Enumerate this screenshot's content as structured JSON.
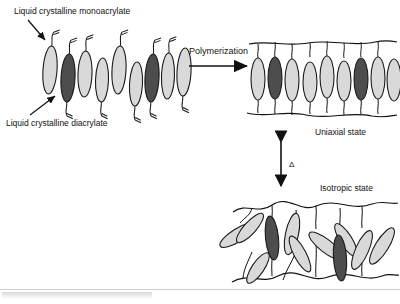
{
  "figure": {
    "type": "schematic-diagram",
    "labels": {
      "monoacrylate": "Liquid crystalline monoacrylate",
      "diacrylate": "Liquid crystalline diacrylate",
      "polymerization": "Polymerization",
      "uniaxial_state": "Uniaxial state",
      "isotropic_state": "Isotropic state",
      "temperature_symbol": "Δ"
    },
    "colors": {
      "monoacrylate_fill": "#d9d9d9",
      "diacrylate_fill": "#4d4d4d",
      "outline": "#1a1a1a",
      "background": "#ffffff",
      "caption_rule": "#cfcfcf"
    },
    "panels": [
      {
        "name": "monomer-mixture",
        "description": "Row of nine tilted rod-like mesogens, light ones are monofunctional with a single acrylate tail, dark ones are difunctional with tails at both ends",
        "mesogen_count": 9,
        "dark_indices": [
          1,
          5
        ],
        "arrow_annotations": [
          {
            "name": "monoacrylate-pointer",
            "points_to": "light mesogen, upper left"
          },
          {
            "name": "diacrylate-pointer",
            "points_to": "dark mesogen, lower left"
          }
        ]
      },
      {
        "name": "uniaxial-network",
        "description": "Nine aligned vertical mesogens cross-linked between two wavy polymer backbone chains",
        "mesogen_count": 9,
        "dark_indices": [
          1,
          6
        ],
        "backbone_chains": 2,
        "order": "aligned / anisotropic"
      },
      {
        "name": "isotropic-network",
        "description": "Randomly oriented mesogens attached to wavy polymer backbones, no preferred direction",
        "mesogen_count": 11,
        "dark_indices": [
          2,
          7
        ],
        "backbone_chains": 2,
        "order": "random / isotropic"
      }
    ],
    "arrows": [
      {
        "name": "polymerization-arrow",
        "direction": "right",
        "label": "Polymerization"
      },
      {
        "name": "phase-transition-arrow",
        "direction": "vertical-double",
        "label": "Δ",
        "connects": [
          "Uniaxial state",
          "Isotropic state"
        ]
      }
    ]
  }
}
